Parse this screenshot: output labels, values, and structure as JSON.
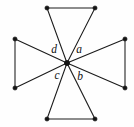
{
  "figure": {
    "background_color": "#fefefe",
    "edge_color": "#1a1a1a",
    "node_color": "#141414",
    "label_color": "#111111",
    "canvas": {
      "width": 134,
      "height": 127
    }
  },
  "center": {
    "name": "center-vertex",
    "x": 67,
    "y": 63
  },
  "outer_vertices": [
    {
      "name": "top-left-vertex",
      "x": 47,
      "y": 8
    },
    {
      "name": "top-right-vertex",
      "x": 95,
      "y": 8
    },
    {
      "name": "right-top-vertex",
      "x": 125,
      "y": 39
    },
    {
      "name": "right-bottom-vertex",
      "x": 125,
      "y": 88
    },
    {
      "name": "bottom-right-vertex",
      "x": 95,
      "y": 119
    },
    {
      "name": "bottom-left-vertex",
      "x": 47,
      "y": 119
    },
    {
      "name": "left-bottom-vertex",
      "x": 15,
      "y": 88
    },
    {
      "name": "left-top-vertex",
      "x": 15,
      "y": 39
    }
  ],
  "edges": [
    {
      "name": "edge-top-base",
      "from": "top-left-vertex",
      "to": "top-right-vertex"
    },
    {
      "name": "edge-top-left-to-center",
      "from": "top-left-vertex",
      "to": "center-vertex"
    },
    {
      "name": "edge-top-right-to-center",
      "from": "top-right-vertex",
      "to": "center-vertex"
    },
    {
      "name": "edge-right-base",
      "from": "right-top-vertex",
      "to": "right-bottom-vertex"
    },
    {
      "name": "edge-right-top-to-center",
      "from": "right-top-vertex",
      "to": "center-vertex"
    },
    {
      "name": "edge-right-bottom-to-center",
      "from": "right-bottom-vertex",
      "to": "center-vertex"
    },
    {
      "name": "edge-bottom-base",
      "from": "bottom-left-vertex",
      "to": "bottom-right-vertex"
    },
    {
      "name": "edge-bottom-left-to-center",
      "from": "bottom-left-vertex",
      "to": "center-vertex"
    },
    {
      "name": "edge-bottom-right-to-center",
      "from": "bottom-right-vertex",
      "to": "center-vertex"
    },
    {
      "name": "edge-left-base",
      "from": "left-top-vertex",
      "to": "left-bottom-vertex"
    },
    {
      "name": "edge-left-top-to-center",
      "from": "left-top-vertex",
      "to": "center-vertex"
    },
    {
      "name": "edge-left-bottom-to-center",
      "from": "left-bottom-vertex",
      "to": "center-vertex"
    }
  ],
  "labels": [
    {
      "name": "angle-label-a",
      "text": "a",
      "x": 79,
      "y": 50
    },
    {
      "name": "angle-label-b",
      "text": "b",
      "x": 80,
      "y": 77
    },
    {
      "name": "angle-label-c",
      "text": "c",
      "x": 57,
      "y": 76
    },
    {
      "name": "angle-label-d",
      "text": "d",
      "x": 54,
      "y": 50
    }
  ]
}
